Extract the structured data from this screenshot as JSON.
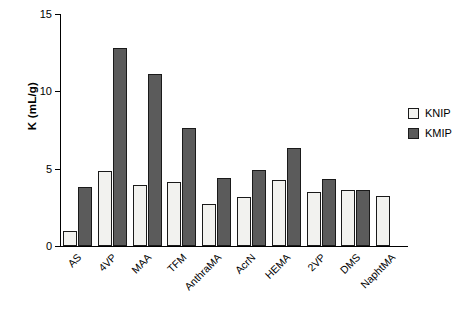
{
  "chart_data": {
    "type": "bar",
    "title": "",
    "xlabel": "",
    "ylabel": "K (mL/g)",
    "ylim": [
      0,
      15
    ],
    "yticks": [
      0,
      5,
      10,
      15
    ],
    "grid": false,
    "legend_position": "right",
    "categories": [
      "AS",
      "4VP",
      "MAA",
      "TFM",
      "AnthraMA",
      "AcrN",
      "HEMA",
      "2VP",
      "DMS",
      "NaphtMA"
    ],
    "series": [
      {
        "name": "KNIP",
        "color": "#f2f2ef",
        "values": [
          0.95,
          4.85,
          3.95,
          4.15,
          2.7,
          3.15,
          4.3,
          3.5,
          3.6,
          3.25
        ]
      },
      {
        "name": "KMIP",
        "color": "#5b5b5b",
        "values": [
          3.8,
          12.8,
          11.15,
          7.6,
          4.4,
          4.9,
          6.35,
          4.35,
          3.6,
          null
        ]
      }
    ]
  },
  "legend": {
    "items": [
      {
        "label": "KNIP"
      },
      {
        "label": "KMIP"
      }
    ]
  }
}
